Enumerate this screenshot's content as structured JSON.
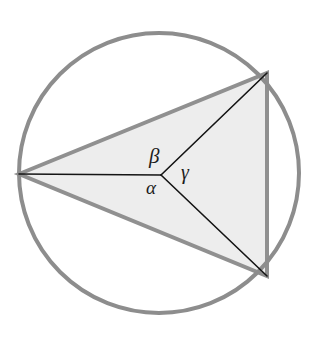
{
  "figure": {
    "background_color": "#ffffff",
    "width": 319,
    "height": 339
  },
  "circle": {
    "name": "circumscribed-circle",
    "center_x": 159,
    "center_y": 173,
    "radius": 140,
    "stroke_color": "#8d8d8d",
    "stroke_width": 4,
    "fill": "none"
  },
  "triangle": {
    "name": "inscribed-triangle",
    "fill_color": "#ededed",
    "stroke_color": "#909090",
    "stroke_width": 4,
    "vertices": [
      {
        "name": "vertex-left",
        "x": 19,
        "y": 174
      },
      {
        "name": "vertex-top-right",
        "x": 267,
        "y": 73
      },
      {
        "name": "vertex-bottom-right",
        "x": 267,
        "y": 276
      }
    ],
    "points_attr": "19,174 267,73 267,276"
  },
  "center_point": {
    "name": "circle-center",
    "x": 161,
    "y": 175
  },
  "radii": [
    {
      "name": "radius-to-left-vertex",
      "x1": 161,
      "y1": 175,
      "x2": 19,
      "y2": 174,
      "stroke_color": "#141414",
      "stroke_width": 1.6
    },
    {
      "name": "radius-to-top-right-vertex",
      "x1": 161,
      "y1": 175,
      "x2": 267,
      "y2": 73,
      "stroke_color": "#141414",
      "stroke_width": 1.6
    },
    {
      "name": "radius-to-bottom-right-vertex",
      "x1": 161,
      "y1": 175,
      "x2": 267,
      "y2": 276,
      "stroke_color": "#141414",
      "stroke_width": 1.6
    }
  ],
  "labels": {
    "alpha": "α",
    "beta": "β",
    "gamma": "γ"
  },
  "chart_data": {
    "type": "diagram",
    "elements": [
      {
        "kind": "circle",
        "label": "circumscribed circle",
        "cx": 159,
        "cy": 173,
        "r": 140
      },
      {
        "kind": "polygon",
        "label": "inscribed triangle",
        "points": [
          [
            19,
            174
          ],
          [
            267,
            73
          ],
          [
            267,
            276
          ]
        ]
      },
      {
        "kind": "segment",
        "label": "radius to left vertex",
        "from": [
          161,
          175
        ],
        "to": [
          19,
          174
        ]
      },
      {
        "kind": "segment",
        "label": "radius to top-right vertex",
        "from": [
          161,
          175
        ],
        "to": [
          267,
          73
        ]
      },
      {
        "kind": "segment",
        "label": "radius to bottom-right vertex",
        "from": [
          161,
          175
        ],
        "to": [
          267,
          276
        ]
      }
    ],
    "annotations": [
      {
        "text": "α",
        "x": 153,
        "y": 189,
        "meaning": "central angle between radius to left vertex and radius to bottom-right vertex"
      },
      {
        "text": "β",
        "x": 156,
        "y": 157,
        "meaning": "central angle between radius to left vertex and radius to top-right vertex"
      },
      {
        "text": "γ",
        "x": 187,
        "y": 173,
        "meaning": "central angle between radius to top-right vertex and radius to bottom-right vertex"
      }
    ]
  }
}
